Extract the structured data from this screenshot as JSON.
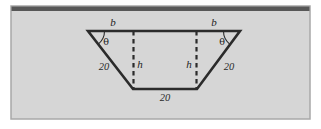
{
  "figure": {
    "panel": {
      "background_color": "#d6d6d6",
      "frame_color": "#a8a8a8",
      "top_band_color": "#575757",
      "page_background": "#ffffff"
    },
    "shape": {
      "name": "trapezoid",
      "stroke_color": "#2b2b2b",
      "dashed_stroke_color": "#2b2b2b",
      "vertices": {
        "top_left": [
          88,
          31
        ],
        "top_right": [
          240,
          31
        ],
        "bottom_left": [
          133,
          89
        ],
        "bottom_right": [
          197,
          89
        ]
      }
    },
    "labels": {
      "top_left_side": "b",
      "top_right_side": "b",
      "angle_left": "θ",
      "angle_right": "θ",
      "slant_left": "20",
      "slant_right": "20",
      "height_left": "h",
      "height_right": "h",
      "bottom_side": "20"
    }
  }
}
